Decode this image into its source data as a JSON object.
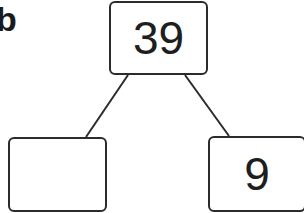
{
  "label": "b",
  "nodes": {
    "top": {
      "value": "39"
    },
    "left": {
      "value": ""
    },
    "right": {
      "value": "9"
    }
  },
  "colors": {
    "stroke": "#2b2b2b",
    "text": "#1e1e1e",
    "background": "#ffffff"
  }
}
